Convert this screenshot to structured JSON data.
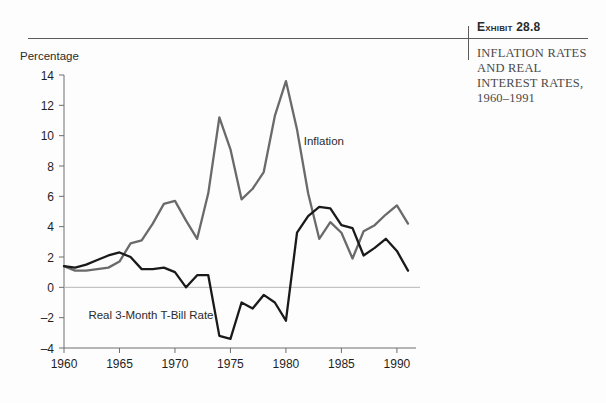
{
  "exhibit": {
    "number_label": "Exhibit 28.8",
    "title_line1": "INFLATION RATES",
    "title_line2": "AND REAL",
    "title_line3": "INTEREST RATES,",
    "title_years": "1960–1991"
  },
  "chart_data": {
    "type": "line",
    "title": "INFLATION RATES AND REAL INTEREST RATES, 1960–1991",
    "xlabel": "",
    "ylabel": "Percentage",
    "ylim": [
      -4,
      14
    ],
    "xlim": [
      1960,
      1991
    ],
    "ytick_labels": [
      "14",
      "12",
      "10",
      "8",
      "6",
      "4",
      "2",
      "0",
      "–2",
      "–4"
    ],
    "yticks": [
      14,
      12,
      10,
      8,
      6,
      4,
      2,
      0,
      -2,
      -4
    ],
    "xtick_labels": [
      "1960",
      "1965",
      "1970",
      "1975",
      "1980",
      "1985",
      "1990"
    ],
    "xticks": [
      1960,
      1965,
      1970,
      1975,
      1980,
      1985,
      1990
    ],
    "grid": false,
    "legend_position": "inline-annotations",
    "zero_line": 0,
    "x": [
      1960,
      1961,
      1962,
      1963,
      1964,
      1965,
      1966,
      1967,
      1968,
      1969,
      1970,
      1971,
      1972,
      1973,
      1974,
      1975,
      1976,
      1977,
      1978,
      1979,
      1980,
      1981,
      1982,
      1983,
      1984,
      1985,
      1986,
      1987,
      1988,
      1989,
      1990,
      1991
    ],
    "series": [
      {
        "name": "Inflation",
        "color": "#6a6a6a",
        "label_x": 1981.6,
        "label_y": 9.4,
        "values": [
          1.4,
          1.1,
          1.1,
          1.2,
          1.3,
          1.7,
          2.9,
          3.1,
          4.2,
          5.5,
          5.7,
          4.4,
          3.2,
          6.2,
          11.2,
          9.1,
          5.8,
          6.5,
          7.6,
          11.3,
          13.6,
          10.4,
          6.2,
          3.2,
          4.3,
          3.6,
          1.9,
          3.7,
          4.1,
          4.8,
          5.4,
          4.2
        ]
      },
      {
        "name": "Real 3-Month T-Bill Rate",
        "color": "#1a1a1a",
        "label_x": 1962.2,
        "label_y": -2.1,
        "values": [
          1.4,
          1.3,
          1.5,
          1.8,
          2.1,
          2.3,
          2.0,
          1.2,
          1.2,
          1.3,
          1.0,
          0.0,
          0.8,
          0.8,
          -3.2,
          -3.4,
          -1.0,
          -1.4,
          -0.5,
          -1.0,
          -2.2,
          3.6,
          4.7,
          5.3,
          5.2,
          4.1,
          3.9,
          2.1,
          2.6,
          3.2,
          2.4,
          1.1
        ]
      }
    ],
    "annotations": [
      {
        "text": "Inflation",
        "x": 1981.6,
        "y": 9.4
      },
      {
        "text": "Real 3-Month T-Bill Rate",
        "x": 1962.2,
        "y": -2.1
      }
    ]
  },
  "axis": {
    "y_axis_title": "Percentage"
  }
}
